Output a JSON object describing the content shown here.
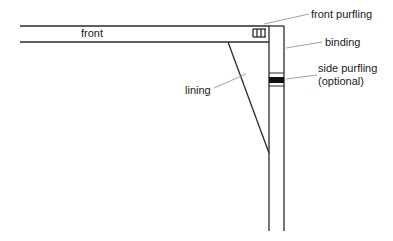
{
  "diagram": {
    "labels": {
      "front": "front",
      "front_purfling": "front purfling",
      "binding": "binding",
      "side_purfling_line1": "side purfling",
      "side_purfling_line2": "(optional)",
      "lining": "lining"
    },
    "colors": {
      "stroke": "#2a2a2a",
      "background": "#ffffff"
    }
  }
}
